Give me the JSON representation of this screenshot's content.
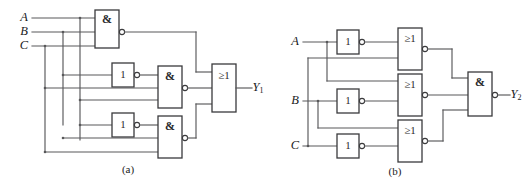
{
  "figure": {
    "width": 526,
    "height": 185,
    "background": "#ffffff",
    "wire_color": "#58585a",
    "gate_stroke": "#3a3a3c"
  },
  "captions": {
    "left": "(a)",
    "right": "(b)"
  },
  "circuit_a": {
    "id": "circuit-a",
    "inputs": [
      {
        "label": "A",
        "name": "input-a"
      },
      {
        "label": "B",
        "name": "input-b"
      },
      {
        "label": "C",
        "name": "input-c"
      }
    ],
    "output": {
      "label": "Y",
      "subscript": "1",
      "name": "output-y1"
    },
    "gates": [
      {
        "name": "nand-gate-top",
        "type": "nand",
        "symbol": "&",
        "inverted": true
      },
      {
        "name": "inverter-middle",
        "type": "not",
        "symbol": "1",
        "inverted": true
      },
      {
        "name": "nand-gate-middle",
        "type": "nand",
        "symbol": "&",
        "inverted": true
      },
      {
        "name": "inverter-bottom",
        "type": "not",
        "symbol": "1",
        "inverted": true
      },
      {
        "name": "nand-gate-bottom",
        "type": "nand",
        "symbol": "&",
        "inverted": true
      },
      {
        "name": "or-gate-output",
        "type": "or",
        "symbol": "≥1",
        "inverted": false
      }
    ]
  },
  "circuit_b": {
    "id": "circuit-b",
    "inputs": [
      {
        "label": "A",
        "name": "input-a"
      },
      {
        "label": "B",
        "name": "input-b"
      },
      {
        "label": "C",
        "name": "input-c"
      }
    ],
    "output": {
      "label": "Y",
      "subscript": "2",
      "name": "output-y2"
    },
    "gates": [
      {
        "name": "inverter-a",
        "type": "not",
        "symbol": "1",
        "inverted": true
      },
      {
        "name": "inverter-b",
        "type": "not",
        "symbol": "1",
        "inverted": true
      },
      {
        "name": "inverter-c",
        "type": "not",
        "symbol": "1",
        "inverted": true
      },
      {
        "name": "nor-gate-top",
        "type": "nor",
        "symbol": "≥1",
        "inverted": true
      },
      {
        "name": "nor-gate-middle",
        "type": "nor",
        "symbol": "≥1",
        "inverted": true
      },
      {
        "name": "nor-gate-bottom",
        "type": "nor",
        "symbol": "≥1",
        "inverted": true
      },
      {
        "name": "nand-gate-output",
        "type": "nand",
        "symbol": "&",
        "inverted": true
      }
    ]
  }
}
